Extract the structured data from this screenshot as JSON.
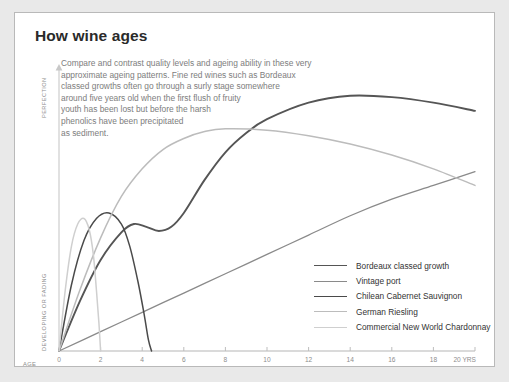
{
  "title": "How wine ages",
  "blurb": "Compare and contrast quality levels and ageing ability in these very\napproximate ageing patterns. Fine red wines such as Bordeaux\nclassed growths often go through a surly stage somewhere\naround five years old when the first flush of fruity\nyouth has been lost but before the harsh\nphenolics have been precipitated\nas sediment.",
  "axes": {
    "y_top_label": "PERFECTION",
    "y_bottom_label": "DEVELOPING OR FADING",
    "x_prefix": "AGE",
    "x_suffix": "20 YRS"
  },
  "chart_data": {
    "type": "line",
    "title": "How wine ages",
    "xlabel": "AGE (YRS)",
    "ylabel": "DEVELOPING OR FADING → PERFECTION",
    "xlim": [
      0,
      20
    ],
    "ylim": [
      0,
      100
    ],
    "grid": false,
    "legend_position": "inside-bottom-right",
    "xticks": [
      "0",
      "2",
      "4",
      "6",
      "8",
      "10",
      "12",
      "14",
      "16",
      "18",
      "20"
    ],
    "series": [
      {
        "name": "Bordeaux classed growth",
        "color": "#555555",
        "width": 1.9,
        "x": [
          0,
          1,
          2,
          3,
          3.6,
          4.2,
          4.8,
          5.4,
          6,
          7,
          8,
          9,
          10,
          12,
          14,
          16,
          18,
          20
        ],
        "y": [
          0,
          18,
          33,
          43,
          46,
          45,
          43.5,
          45,
          50,
          62,
          72,
          79,
          84,
          90,
          92.5,
          92,
          90,
          87
        ]
      },
      {
        "name": "Vintage port",
        "color": "#8a8a8a",
        "width": 1.3,
        "x": [
          0,
          2,
          4,
          6,
          8,
          10,
          12,
          14,
          16,
          18,
          20
        ],
        "y": [
          0,
          7,
          14,
          21,
          28,
          35,
          42,
          49,
          55,
          60,
          65
        ]
      },
      {
        "name": "Chilean Cabernet Sauvignon",
        "color": "#4a4a4a",
        "width": 1.5,
        "x": [
          0,
          0.6,
          1.2,
          1.8,
          2.4,
          3,
          3.4,
          3.8,
          4.1,
          4.3,
          4.45
        ],
        "y": [
          0,
          24,
          40,
          48,
          50,
          46,
          38,
          25,
          13,
          4,
          0
        ]
      },
      {
        "name": "German Riesling",
        "color": "#bcbcbc",
        "width": 1.5,
        "x": [
          0,
          1,
          2,
          3,
          4,
          5,
          6,
          7,
          8,
          10,
          12,
          14,
          16,
          18,
          20
        ],
        "y": [
          0,
          22,
          41,
          56,
          66,
          73,
          77,
          79.5,
          80.5,
          80,
          78,
          75,
          71,
          66,
          60
        ]
      },
      {
        "name": "Commercial New World Chardonnay",
        "color": "#cfcfcf",
        "width": 1.5,
        "x": [
          0,
          0.3,
          0.6,
          0.9,
          1.2,
          1.45,
          1.65,
          1.8,
          1.92,
          2.0
        ],
        "y": [
          0,
          22,
          38,
          46,
          48,
          44,
          35,
          22,
          10,
          0
        ]
      }
    ]
  },
  "legend": [
    {
      "label": "Bordeaux classed growth",
      "color": "#555555",
      "width": 1.9
    },
    {
      "label": "Vintage port",
      "color": "#8a8a8a",
      "width": 1.3
    },
    {
      "label": "Chilean Cabernet Sauvignon",
      "color": "#4a4a4a",
      "width": 1.5
    },
    {
      "label": "German Riesling",
      "color": "#bcbcbc",
      "width": 1.5
    },
    {
      "label": "Commercial New World Chardonnay",
      "color": "#cfcfcf",
      "width": 1.5
    }
  ]
}
